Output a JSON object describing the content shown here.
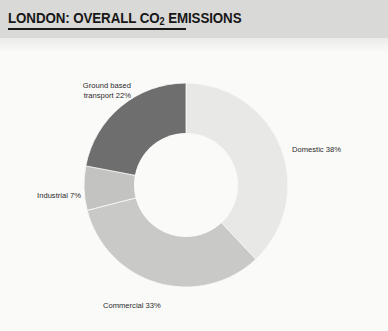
{
  "header": {
    "title_prefix": "LONDON: OVERALL CO",
    "title_subscript": "2",
    "title_suffix": " EMISSIONS",
    "band_color": "#d9d9d7",
    "text_color": "#171717"
  },
  "labels": {
    "transport": "Ground based\ntransport 22%",
    "domestic": "Domestic 38%",
    "industrial": "Industrial 7%",
    "commercial": "Commercial 33%"
  },
  "chart_data": {
    "type": "pie",
    "variant": "donut",
    "title": "LONDON: OVERALL CO2 EMISSIONS",
    "categories": [
      "Domestic",
      "Commercial",
      "Industrial",
      "Ground based transport"
    ],
    "values": [
      38,
      33,
      7,
      22
    ],
    "unit": "%",
    "labels": [
      "Domestic 38%",
      "Commercial 33%",
      "Industrial 7%",
      "Ground based transport 22%"
    ],
    "colors": [
      "#e8e8e6",
      "#c9c9c7",
      "#c3c3c1",
      "#6e6e6e"
    ],
    "start_angle_deg": 0,
    "direction": "clockwise",
    "center": [
      102,
      102
    ],
    "outer_radius": 102,
    "inner_radius": 52,
    "hole_color": "#fafaf9",
    "legend": "none",
    "grid": false,
    "label_placement": "outside-callout"
  }
}
